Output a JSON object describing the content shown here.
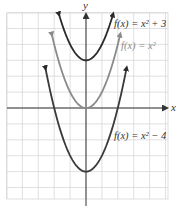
{
  "chart_data": {
    "type": "line",
    "title": "",
    "xlabel": "x",
    "ylabel": "y",
    "xlim": [
      -5,
      5.2
    ],
    "ylim": [
      -5.7,
      5.9
    ],
    "grid": true,
    "grid_step": 1,
    "legend_position": "inline labels near curves (right)",
    "series": [
      {
        "name": "f(x) = x^2 + 3",
        "label": "f(x) = x² + 3",
        "expression": "x^2 + 3",
        "vertex": [
          0,
          3
        ],
        "x_range": [
          -1.7,
          1.7
        ],
        "color": "#2a2a2a"
      },
      {
        "name": "f(x) = x^2",
        "label": "f(x) = x²",
        "expression": "x^2",
        "vertex": [
          0,
          0
        ],
        "x_range": [
          -2.15,
          2.15
        ],
        "color": "#8a8a8a"
      },
      {
        "name": "f(x) = x^2 - 4",
        "label": "f(x) = x² − 4",
        "expression": "x^2 - 4",
        "vertex": [
          0,
          -4
        ],
        "x_range": [
          -2.55,
          2.55
        ],
        "color": "#3a3a3a"
      }
    ]
  },
  "axes": {
    "x_label": "x",
    "y_label": "y"
  },
  "labels": {
    "top": "f(x) = x² + 3",
    "middle": "f(x) = x²",
    "bottom": "f(x) = x² − 4"
  },
  "colors": {
    "grid": "#d8d8d8",
    "axis": "#333333",
    "dark_curve": "#2a2a2a",
    "light_curve": "#8a8a8a",
    "label_dark": "#333333",
    "label_light": "#8a8a8a"
  }
}
